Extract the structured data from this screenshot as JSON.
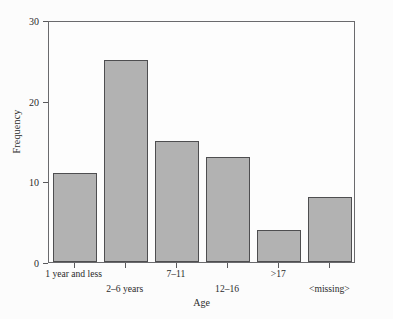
{
  "chart_data": {
    "type": "bar",
    "title": "",
    "xlabel": "Age",
    "ylabel": "Frequency",
    "categories": [
      "1 year and less",
      "2–6 years",
      "7–11",
      "12–16",
      ">17",
      "<missing>"
    ],
    "values": [
      11,
      25,
      15,
      13,
      4,
      8
    ],
    "ylim": [
      0,
      30
    ],
    "yticks": [
      0,
      10,
      20,
      30
    ],
    "ytick_labels": [
      "0",
      "10",
      "20",
      "30"
    ],
    "grid": false,
    "legend": false,
    "label_rows": [
      "a",
      "b",
      "a",
      "b",
      "a",
      "b"
    ],
    "bar_color": "#b2b2b2",
    "bar_edge_color": "#4e4e50",
    "axis_color": "#6a6a6d",
    "background_color": "#fcfcfc"
  }
}
